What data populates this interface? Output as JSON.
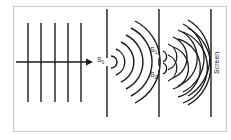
{
  "diagram": {
    "labels": {
      "s0": "S",
      "s0_sub": "0",
      "s1": "S",
      "s1_sub": "1",
      "s2": "S",
      "s2_sub": "2",
      "screen": "Screen"
    },
    "elements": [
      "plane wavefronts",
      "incident ray arrow",
      "single slit S0",
      "circular wavefronts",
      "double slit S1 S2",
      "interfering wavefronts",
      "screen"
    ],
    "colors": {
      "line": "#1a1a1a",
      "border": "#c8c8c8",
      "background": "#ffffff"
    }
  }
}
